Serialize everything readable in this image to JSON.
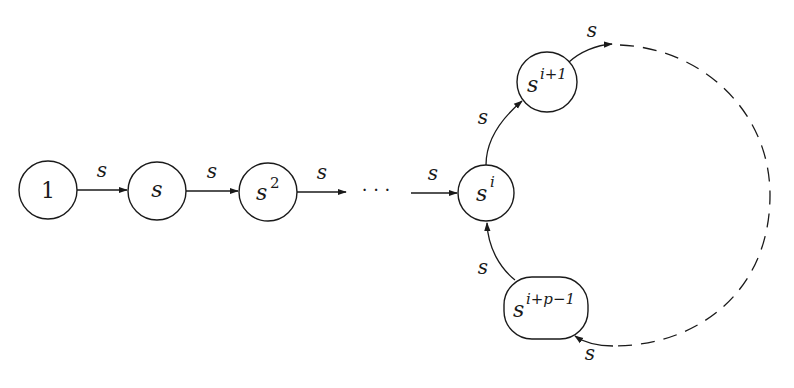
{
  "diagram": {
    "type": "state-transition-graph",
    "nodes": [
      {
        "id": "n1",
        "label": "1",
        "base": "1",
        "sup": ""
      },
      {
        "id": "ns",
        "label": "s",
        "base": "s",
        "sup": ""
      },
      {
        "id": "ns2",
        "label": "s^2",
        "base": "s",
        "sup": "2"
      },
      {
        "id": "nsi",
        "label": "s^i",
        "base": "s",
        "sup": "i"
      },
      {
        "id": "nsi1",
        "label": "s^{i+1}",
        "base": "s",
        "sup": "i+1"
      },
      {
        "id": "nsip",
        "label": "s^{i+p-1}",
        "base": "s",
        "sup": "i+p−1"
      }
    ],
    "ellipsis": "· · ·",
    "edges": [
      {
        "from": "n1",
        "to": "ns",
        "label": "s"
      },
      {
        "from": "ns",
        "to": "ns2",
        "label": "s"
      },
      {
        "from": "ns2",
        "to": "ellipsis",
        "label": "s"
      },
      {
        "from": "ellipsis",
        "to": "nsi",
        "label": "s"
      },
      {
        "from": "nsi",
        "to": "nsi1",
        "label": "s"
      },
      {
        "from": "nsi1",
        "to": "dashed-arc",
        "label": "s"
      },
      {
        "from": "dashed-arc",
        "to": "nsip",
        "label": "s"
      },
      {
        "from": "nsip",
        "to": "nsi",
        "label": "s"
      }
    ]
  }
}
